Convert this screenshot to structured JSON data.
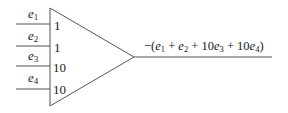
{
  "diagram": {
    "type": "summing-amplifier",
    "inputs": [
      {
        "name": "e",
        "sub": "1",
        "weight": "1"
      },
      {
        "name": "e",
        "sub": "2",
        "weight": "1"
      },
      {
        "name": "e",
        "sub": "3",
        "weight": "10"
      },
      {
        "name": "e",
        "sub": "4",
        "weight": "10"
      }
    ],
    "output": {
      "text": "−(e1 + e2 + 10e3 + 10e4)",
      "parts": {
        "open": "−(",
        "t1": "e",
        "s1": "1",
        "plus1": " + ",
        "t2": "e",
        "s2": "2",
        "plus2": " + 10",
        "t3": "e",
        "s3": "3",
        "plus3": " + 10",
        "t4": "e",
        "s4": "4",
        "close": ")"
      }
    },
    "colors": {
      "stroke": "#555555",
      "text": "#1a1a1a",
      "background": "#ffffff"
    }
  }
}
